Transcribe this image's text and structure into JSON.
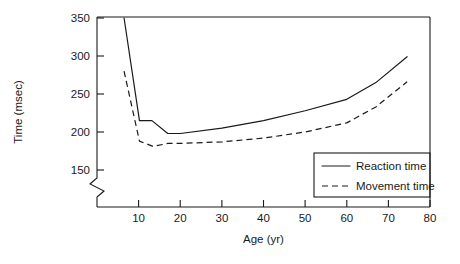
{
  "chart_data": {
    "type": "line",
    "title": "",
    "xlabel": "Age (yr)",
    "ylabel": "Time (msec)",
    "xlim": [
      0,
      80
    ],
    "ylim": [
      150,
      350
    ],
    "y_axis_break": true,
    "grid": false,
    "legend_position": "bottom-right",
    "xticks": [
      10,
      20,
      30,
      40,
      50,
      60,
      70,
      80
    ],
    "xtick_labels": [
      "10",
      "20",
      "30",
      "40",
      "50",
      "60",
      "70",
      "80"
    ],
    "yticks": [
      150,
      200,
      250,
      300,
      350
    ],
    "ytick_labels": [
      "150",
      "200",
      "250",
      "300",
      "350"
    ],
    "series": [
      {
        "name": "Reaction time",
        "style": "solid",
        "x": [
          6.5,
          10.2,
          13.2,
          17.0,
          20.0,
          30.0,
          40.0,
          50.0,
          60.0,
          67.0,
          74.5
        ],
        "values": [
          350,
          215,
          215,
          198,
          198,
          205,
          215,
          228,
          243,
          265,
          299
        ]
      },
      {
        "name": "Movement time",
        "style": "dashed",
        "x": [
          6.5,
          10.2,
          13.5,
          17.0,
          20.0,
          30.0,
          40.0,
          50.0,
          60.0,
          67.0,
          74.5
        ],
        "values": [
          280,
          188,
          181,
          185,
          185,
          187,
          192,
          200,
          212,
          233,
          266
        ]
      }
    ]
  },
  "legend": {
    "entries": [
      {
        "label": "Reaction time",
        "style": "solid"
      },
      {
        "label": "Movement time",
        "style": "dashed"
      }
    ]
  },
  "axes": {
    "x_title": "Age (yr)",
    "y_title": "Time (msec)"
  }
}
